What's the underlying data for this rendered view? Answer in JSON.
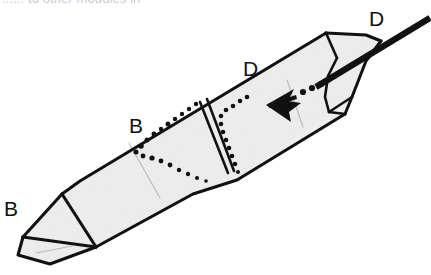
{
  "figure": {
    "caption_partial": "...... to other modules in",
    "background_color": "#ffffff",
    "ink_color": "#111111",
    "paper_fill": "#ededed",
    "crease_color": "#b4b4b4",
    "labels": [
      {
        "id": "label-d-top-right",
        "text": "D",
        "x": 372,
        "y": 26
      },
      {
        "id": "label-d-middle",
        "text": "D",
        "x": 243,
        "y": 76
      },
      {
        "id": "label-b-middle",
        "text": "B",
        "x": 131,
        "y": 133
      },
      {
        "id": "label-b-left",
        "text": "B",
        "x": 6,
        "y": 215
      }
    ],
    "annotations": {
      "arrow": {
        "name": "insertion-arrow",
        "direction": "left-down-pointing",
        "tail_style": "dotted",
        "tip_x": 269,
        "tip_y": 104,
        "dots": [
          [
            302,
            92
          ],
          [
            310,
            88
          ],
          [
            318,
            85
          ]
        ]
      },
      "dotted_seam_count": 2,
      "double_fold_line": true
    },
    "geometry": {
      "body_outline": "M 23 237 L 63 193 L 80 181 L 327 33 L 366 35 L 381 41 L 366 61 L 352 97 L 346 113 L 237 180 L 192 194 L 95 247 L 50 263 L 18 254 Z",
      "note": "elongated folded tube running lower-left to upper-right"
    }
  }
}
